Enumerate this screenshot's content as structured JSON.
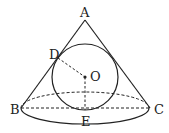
{
  "figure": {
    "stroke_color": "#222222",
    "background": "#ffffff"
  },
  "labels": {
    "A": "A",
    "B": "B",
    "C": "C",
    "D": "D",
    "E": "E",
    "O": "O"
  },
  "points": {
    "A": [
      85,
      20
    ],
    "B": [
      21,
      108
    ],
    "C": [
      150,
      108
    ],
    "D": [
      58,
      58
    ],
    "E": [
      85,
      110
    ],
    "O": [
      85,
      77
    ]
  },
  "shapes": {
    "cone_base_ellipse": {
      "cx": 85,
      "cy": 108,
      "rx": 64,
      "ry": 16
    },
    "inscribed_circle": {
      "cx": 85,
      "cy": 77,
      "r": 33
    }
  }
}
